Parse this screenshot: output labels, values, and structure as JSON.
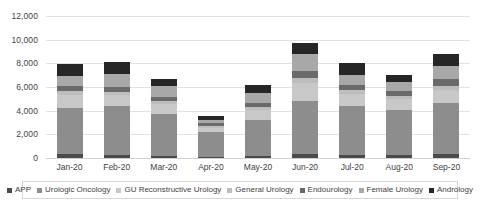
{
  "chart_data": {
    "type": "bar",
    "stacked": true,
    "title": "",
    "xlabel": "",
    "ylabel": "",
    "ylim": [
      0,
      12000
    ],
    "ytick_step": 2000,
    "ytick_labels": [
      "12,000",
      "10,000",
      "8,000",
      "6,000",
      "4,000",
      "2,000",
      "0"
    ],
    "ytick_values": [
      12000,
      10000,
      8000,
      6000,
      4000,
      2000,
      0
    ],
    "grid": true,
    "legend_position": "bottom",
    "categories": [
      "Jan-20",
      "Feb-20",
      "Mar-20",
      "Apr-20",
      "May-20",
      "Jun-20",
      "Jul-20",
      "Aug-20",
      "Sep-20"
    ],
    "series": [
      {
        "name": "APP",
        "color": "#4a4a4a",
        "values": [
          300,
          290,
          180,
          120,
          180,
          320,
          280,
          260,
          330
        ]
      },
      {
        "name": "Urologic Oncology",
        "color": "#8d8d8d",
        "values": [
          3900,
          4100,
          3500,
          2050,
          3050,
          4500,
          4150,
          3800,
          4300
        ]
      },
      {
        "name": "GU Reconstructive Urology",
        "color": "#c8c8c8",
        "values": [
          1150,
          900,
          900,
          400,
          800,
          1500,
          950,
          900,
          1100
        ]
      },
      {
        "name": "General Urology",
        "color": "#bdbdbd",
        "values": [
          350,
          330,
          260,
          160,
          260,
          430,
          350,
          300,
          380
        ]
      },
      {
        "name": "Endourology",
        "color": "#6a6a6a",
        "values": [
          420,
          420,
          350,
          200,
          330,
          620,
          430,
          370,
          540
        ]
      },
      {
        "name": "Female Urology",
        "color": "#a8a8a8",
        "values": [
          850,
          1060,
          930,
          300,
          900,
          1450,
          900,
          790,
          1100
        ]
      },
      {
        "name": "Andrology",
        "color": "#262626",
        "values": [
          980,
          1000,
          580,
          320,
          680,
          880,
          940,
          580,
          1050
        ]
      }
    ],
    "totals": [
      7950,
      8100,
      6700,
      3550,
      6200,
      9700,
      8000,
      7000,
      8800
    ]
  }
}
